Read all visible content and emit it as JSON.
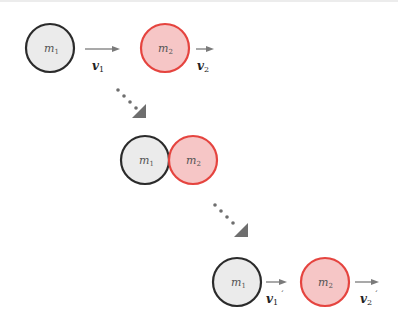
{
  "diagram": {
    "colors": {
      "mass1_fill": "#ebebeb",
      "mass1_stroke": "#2b2b2b",
      "mass2_fill": "#f6c6c6",
      "mass2_stroke": "#e5443f",
      "arrow": "#7a7a7a",
      "step_arrow": "#6e6e6e"
    },
    "stages": [
      {
        "name": "before",
        "mass1": {
          "label": "m",
          "sub": "1",
          "cx": 50,
          "cy": 48
        },
        "mass2": {
          "label": "m",
          "sub": "2",
          "cx": 165,
          "cy": 48
        },
        "v1": {
          "label": "v",
          "sub": "1",
          "prime": ""
        },
        "v2": {
          "label": "v",
          "sub": "2",
          "prime": ""
        }
      },
      {
        "name": "collision",
        "mass1": {
          "label": "m",
          "sub": "1",
          "cx": 145,
          "cy": 160
        },
        "mass2": {
          "label": "m",
          "sub": "2",
          "cx": 193,
          "cy": 160
        }
      },
      {
        "name": "after",
        "mass1": {
          "label": "m",
          "sub": "1",
          "cx": 237,
          "cy": 282
        },
        "mass2": {
          "label": "m",
          "sub": "2",
          "cx": 325,
          "cy": 282
        },
        "v1": {
          "label": "v",
          "sub": "1",
          "prime": "´"
        },
        "v2": {
          "label": "v",
          "sub": "2",
          "prime": "´"
        }
      }
    ],
    "radius": 24
  }
}
